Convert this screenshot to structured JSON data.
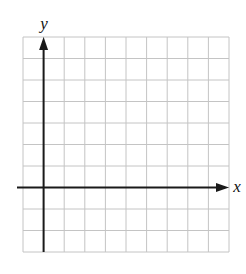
{
  "diagram": {
    "type": "coordinate-grid",
    "x_axis_label": "x",
    "y_axis_label": "y",
    "grid": {
      "columns": 10,
      "rows": 10,
      "y_axis_column_index": 1,
      "x_axis_row_index_from_top": 7
    },
    "colors": {
      "grid_line": "#c4c4c4",
      "axis": "#1a1a1a",
      "label": "#111111",
      "background": "#ffffff"
    }
  }
}
